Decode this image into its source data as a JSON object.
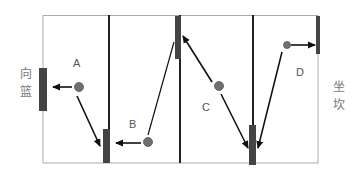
{
  "diagram": {
    "side_labels": {
      "left": [
        "向",
        "篮"
      ],
      "right": [
        "坐",
        "坎"
      ]
    },
    "points": [
      {
        "id": "A",
        "label": "A"
      },
      {
        "id": "B",
        "label": "B"
      },
      {
        "id": "C",
        "label": "C"
      },
      {
        "id": "D",
        "label": "D"
      }
    ],
    "colors": {
      "border": "#aaaaaa",
      "divider": "#222222",
      "bar": "#444444",
      "ball": "#707070",
      "arrow": "#111111"
    }
  }
}
